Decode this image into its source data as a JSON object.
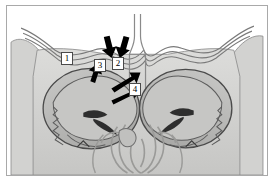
{
  "figure": {
    "kind": "anatomical-illustration",
    "view": "coronal section through the orbits and paranasal sinuses",
    "style": "grayscale line drawing",
    "frame_color": "#a9a9a9",
    "background_color": "#ffffff"
  },
  "palette": {
    "paper": "#ffffff",
    "tissue_light": "#d8d8d6",
    "tissue_mid": "#c3c3c1",
    "tissue_dark": "#a8a8a6",
    "orbit_fill": "#b9b9b7",
    "orbit_inner": "#c9c9c7",
    "outline": "#6e6e6e",
    "outline_dark": "#3c3c3c",
    "arrow_black": "#000000",
    "label_box": "#ffffff",
    "label_text": "#000000"
  },
  "labels": [
    {
      "id": "label-1",
      "text": "1",
      "x": 60,
      "y": 52
    },
    {
      "id": "label-2",
      "text": "2",
      "x": 110,
      "y": 57
    },
    {
      "id": "label-3",
      "text": "3",
      "x": 92,
      "y": 59
    },
    {
      "id": "label-4",
      "text": "4",
      "x": 128,
      "y": 83
    }
  ],
  "arrows": [
    {
      "id": "arrow-1",
      "points_to": "label-2",
      "direction": "down-right"
    },
    {
      "id": "arrow-2",
      "points_to": "label-2",
      "direction": "down-left"
    },
    {
      "id": "arrow-3",
      "points_to": "label-3",
      "direction": "up-right"
    },
    {
      "id": "arrow-4",
      "points_to": "label-4",
      "direction": "up-right"
    },
    {
      "id": "arrow-5",
      "points_to": "label-4",
      "direction": "right"
    }
  ]
}
